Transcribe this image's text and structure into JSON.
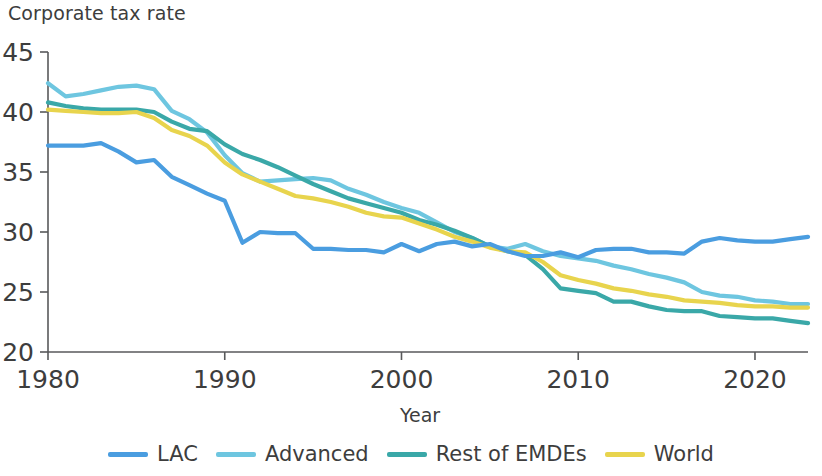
{
  "chart_data": {
    "type": "line",
    "title": "Corporate tax rate",
    "xlabel": "Year",
    "ylabel": "",
    "xlim": [
      1980,
      2023
    ],
    "ylim": [
      20,
      45
    ],
    "xticks": [
      1980,
      1990,
      2000,
      2010,
      2020
    ],
    "yticks": [
      20,
      25,
      30,
      35,
      40,
      45
    ],
    "xtick_labels": [
      "1980",
      "1990",
      "2000",
      "2010",
      "2020"
    ],
    "ytick_labels": [
      "20",
      "25",
      "30",
      "35",
      "40",
      "45"
    ],
    "grid": false,
    "legend_position": "bottom",
    "x": [
      1980,
      1981,
      1982,
      1983,
      1984,
      1985,
      1986,
      1987,
      1988,
      1989,
      1990,
      1991,
      1992,
      1993,
      1994,
      1995,
      1996,
      1997,
      1998,
      1999,
      2000,
      2001,
      2002,
      2003,
      2004,
      2005,
      2006,
      2007,
      2008,
      2009,
      2010,
      2011,
      2012,
      2013,
      2014,
      2015,
      2016,
      2017,
      2018,
      2019,
      2020,
      2021,
      2022,
      2023
    ],
    "series": [
      {
        "name": "LAC",
        "color": "#4a9de0",
        "values": [
          37.2,
          37.2,
          37.2,
          37.4,
          36.7,
          35.8,
          36.0,
          34.6,
          33.9,
          33.2,
          32.6,
          29.1,
          30.0,
          29.9,
          29.9,
          28.6,
          28.6,
          28.5,
          28.5,
          28.3,
          29.0,
          28.4,
          29.0,
          29.2,
          28.8,
          29.0,
          28.4,
          28.0,
          28.0,
          28.3,
          27.9,
          28.5,
          28.6,
          28.6,
          28.3,
          28.3,
          28.2,
          29.2,
          29.5,
          29.3,
          29.2,
          29.2,
          29.4,
          29.6
        ]
      },
      {
        "name": "Advanced",
        "color": "#6ec6e0",
        "values": [
          42.4,
          41.3,
          41.5,
          41.8,
          42.1,
          42.2,
          41.9,
          40.1,
          39.4,
          38.3,
          36.4,
          34.9,
          34.2,
          34.3,
          34.4,
          34.5,
          34.3,
          33.6,
          33.1,
          32.5,
          32.0,
          31.6,
          30.8,
          30.0,
          29.5,
          28.8,
          28.6,
          29.0,
          28.4,
          28.0,
          27.8,
          27.6,
          27.2,
          26.9,
          26.5,
          26.2,
          25.8,
          25.0,
          24.7,
          24.6,
          24.3,
          24.2,
          24.0,
          24.0
        ]
      },
      {
        "name": "Rest of EMDEs",
        "color": "#3aa8a8",
        "values": [
          40.8,
          40.5,
          40.3,
          40.2,
          40.2,
          40.2,
          40.0,
          39.2,
          38.6,
          38.4,
          37.3,
          36.5,
          36.0,
          35.4,
          34.7,
          34.0,
          33.4,
          32.8,
          32.4,
          32.0,
          31.6,
          31.0,
          30.6,
          30.1,
          29.5,
          28.8,
          28.4,
          28.1,
          26.9,
          25.3,
          25.1,
          24.9,
          24.2,
          24.2,
          23.8,
          23.5,
          23.4,
          23.4,
          23.0,
          22.9,
          22.8,
          22.8,
          22.6,
          22.4
        ]
      },
      {
        "name": "World",
        "color": "#e8d44d",
        "values": [
          40.2,
          40.1,
          40.0,
          39.9,
          39.9,
          40.0,
          39.5,
          38.5,
          38.0,
          37.2,
          35.8,
          34.8,
          34.2,
          33.6,
          33.0,
          32.8,
          32.5,
          32.1,
          31.6,
          31.3,
          31.2,
          30.7,
          30.2,
          29.6,
          29.2,
          28.7,
          28.4,
          28.3,
          27.5,
          26.4,
          26.0,
          25.7,
          25.3,
          25.1,
          24.8,
          24.6,
          24.3,
          24.2,
          24.1,
          23.9,
          23.8,
          23.8,
          23.7,
          23.7
        ]
      }
    ]
  },
  "legend": {
    "items": [
      {
        "label": "LAC",
        "color": "#4a9de0"
      },
      {
        "label": "Advanced",
        "color": "#6ec6e0"
      },
      {
        "label": "Rest of EMDEs",
        "color": "#3aa8a8"
      },
      {
        "label": "World",
        "color": "#e8d44d"
      }
    ]
  }
}
